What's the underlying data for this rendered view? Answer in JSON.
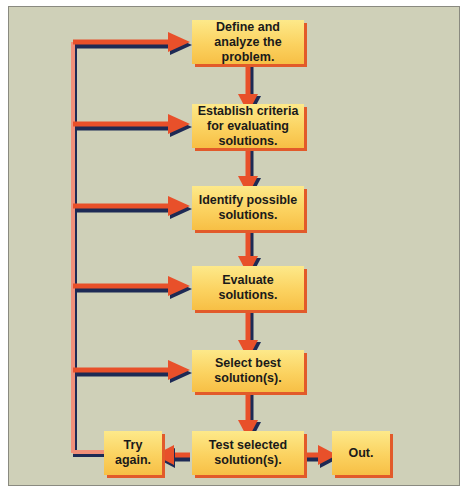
{
  "diagram": {
    "type": "flowchart",
    "title": "",
    "colors": {
      "background": "#cfd0b8",
      "box_fill": "#fbd260",
      "box_shadow": "#e25a2a",
      "arrow": "#e8502a",
      "arrow_shadow": "#1d2a55",
      "feedback_line": "#f0907a"
    },
    "steps": [
      {
        "id": "define",
        "label": "Define and analyze the problem."
      },
      {
        "id": "criteria",
        "label": "Establish criteria for evaluating solutions."
      },
      {
        "id": "identify",
        "label": "Identify possible solutions."
      },
      {
        "id": "evaluate",
        "label": "Evaluate solutions."
      },
      {
        "id": "select",
        "label": "Select best solution(s)."
      },
      {
        "id": "test",
        "label": "Test selected solution(s)."
      },
      {
        "id": "try",
        "label": "Try again."
      },
      {
        "id": "out",
        "label": "Out."
      }
    ],
    "edges": [
      {
        "from": "define",
        "to": "criteria"
      },
      {
        "from": "criteria",
        "to": "identify"
      },
      {
        "from": "identify",
        "to": "evaluate"
      },
      {
        "from": "evaluate",
        "to": "select"
      },
      {
        "from": "select",
        "to": "test"
      },
      {
        "from": "test",
        "to": "try"
      },
      {
        "from": "test",
        "to": "out"
      },
      {
        "from": "try",
        "to": "define"
      },
      {
        "from": "try",
        "to": "criteria"
      },
      {
        "from": "try",
        "to": "identify"
      },
      {
        "from": "try",
        "to": "evaluate"
      },
      {
        "from": "try",
        "to": "select"
      }
    ]
  }
}
